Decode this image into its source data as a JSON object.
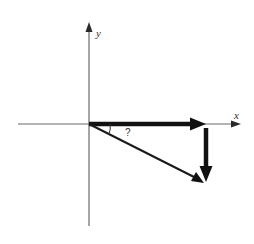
{
  "diagram": {
    "axes": {
      "x_label": "x",
      "y_label": "y"
    },
    "vectors": [
      {
        "name": "horizontal-component",
        "direction": "positive x",
        "style": "thick"
      },
      {
        "name": "vertical-component",
        "direction": "negative y",
        "style": "thick"
      },
      {
        "name": "resultant",
        "direction": "down-right from origin",
        "style": "medium"
      }
    ],
    "angle": {
      "label": "?",
      "between": [
        "horizontal-component",
        "resultant"
      ]
    },
    "colors": {
      "axes": "#6a6a6a",
      "vectors": "#111111",
      "background": "#ffffff"
    }
  }
}
